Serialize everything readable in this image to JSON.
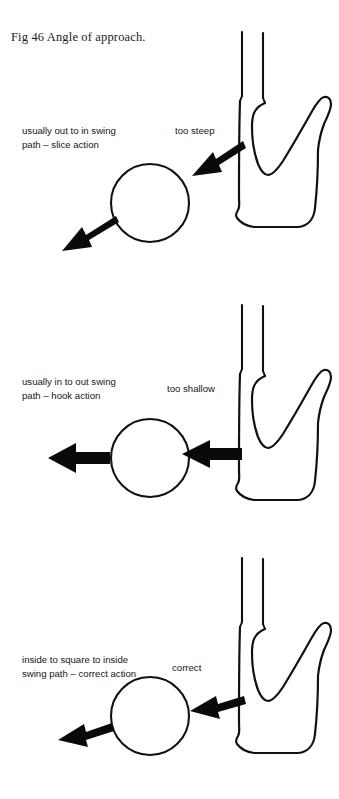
{
  "figure": {
    "caption": "Fig 46  Angle of approach.",
    "page_background": "#ffffff",
    "ink_color": "#111111"
  },
  "panels": [
    {
      "id": "panel-too-steep",
      "swing_label": "usually out to in swing\npath – slice action",
      "angle_label": "too steep",
      "ball_name": "golf-ball",
      "club_name": "golf-club-head",
      "incoming_arrow": "steep-descending-arrow",
      "outgoing_arrow": "ball-flight-arrow"
    },
    {
      "id": "panel-too-shallow",
      "swing_label": "usually in to out swing\npath – hook action",
      "angle_label": "too shallow",
      "ball_name": "golf-ball",
      "club_name": "golf-club-head",
      "incoming_arrow": "shallow-level-arrow",
      "outgoing_arrow": "ball-flight-arrow"
    },
    {
      "id": "panel-correct",
      "swing_label": "inside to square to inside\nswing path – correct action",
      "angle_label": "correct",
      "ball_name": "golf-ball",
      "club_name": "golf-club-head",
      "incoming_arrow": "correct-angle-arrow",
      "outgoing_arrow": "ball-flight-arrow"
    }
  ]
}
